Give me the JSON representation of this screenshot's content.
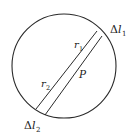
{
  "diagram": {
    "labels": {
      "delta_l1": {
        "prefix": "Δ",
        "var": "l",
        "sub": "1"
      },
      "delta_l2": {
        "prefix": "Δ",
        "var": "l",
        "sub": "2"
      },
      "r1": {
        "var": "r",
        "sub": "1"
      },
      "r2": {
        "var": "r",
        "sub": "2"
      },
      "point": "P"
    },
    "colors": {
      "stroke": "#2a2a2a",
      "background": "#ffffff"
    }
  }
}
